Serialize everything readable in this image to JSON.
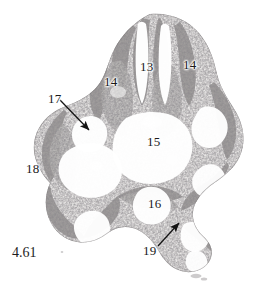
{
  "figure": {
    "number": "4.61",
    "kind": "histological-micrograph",
    "background_color": "#ffffff",
    "ink_color": "#1a1a1a",
    "width": 263,
    "height": 296
  },
  "labels": [
    {
      "id": "13",
      "text": "13",
      "x": 140,
      "y": 60,
      "has_arrow": false
    },
    {
      "id": "14l",
      "text": "14",
      "x": 104,
      "y": 75,
      "has_arrow": false
    },
    {
      "id": "14r",
      "text": "14",
      "x": 183,
      "y": 58,
      "has_arrow": false
    },
    {
      "id": "15",
      "text": "15",
      "x": 147,
      "y": 135,
      "has_arrow": false
    },
    {
      "id": "16",
      "text": "16",
      "x": 148,
      "y": 197,
      "has_arrow": false
    },
    {
      "id": "17",
      "text": "17",
      "x": 48,
      "y": 92,
      "has_arrow": true
    },
    {
      "id": "18",
      "text": "18",
      "x": 26,
      "y": 162,
      "has_arrow": false
    },
    {
      "id": "19",
      "text": "19",
      "x": 143,
      "y": 244,
      "has_arrow": true
    }
  ],
  "arrows": [
    {
      "name": "arrow-to-17",
      "from_x": 60,
      "from_y": 100,
      "to_x": 89,
      "to_y": 130
    },
    {
      "name": "arrow-to-19",
      "from_x": 158,
      "from_y": 246,
      "to_x": 179,
      "to_y": 223
    }
  ]
}
